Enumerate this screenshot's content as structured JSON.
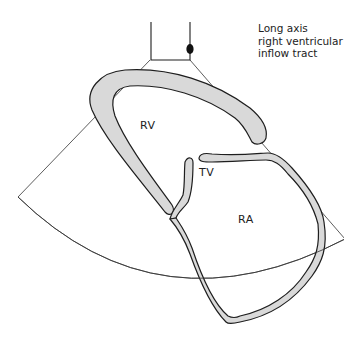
{
  "figure": {
    "caption_lines": "Long axis\nright ventricular\ninflow tract",
    "labels": {
      "rv": "RV",
      "tv": "TV",
      "ra": "RA"
    },
    "colors": {
      "wall_fill": "#d9d9d9",
      "outline": "#1e1e1e",
      "background": "#ffffff"
    }
  }
}
